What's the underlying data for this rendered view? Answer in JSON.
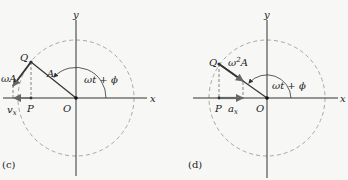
{
  "colors": {
    "background": "#f7f7f5",
    "axis": "#333333",
    "circle": "#a8a8a8",
    "vector": "#3a3a3a",
    "arrow": "#666666",
    "text": "#222222"
  },
  "panels": [
    {
      "id": "c",
      "caption": "(c)",
      "axis_x_label": "x",
      "axis_y_label": "y",
      "origin_label": "O",
      "point_q_label": "Q",
      "point_p_label": "P",
      "radius_label": "A",
      "angle_label": "ωt + ϕ",
      "vector_label": "ωA",
      "component_label": "v",
      "component_subscript": "x"
    },
    {
      "id": "d",
      "caption": "(d)",
      "axis_x_label": "x",
      "axis_y_label": "y",
      "origin_label": "O",
      "point_q_label": "Q",
      "point_p_label": "P",
      "vector_label_base": "ω",
      "vector_label_sup": "2",
      "vector_label_tail": "A",
      "angle_label": "ωt + ϕ",
      "component_label": "a",
      "component_subscript": "x"
    }
  ]
}
